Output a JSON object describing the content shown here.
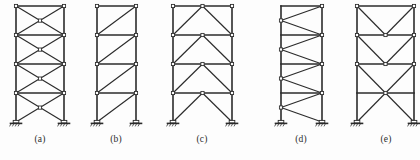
{
  "figure": {
    "background_color": "#fdfdfd",
    "line_color": "#2b2b2b",
    "joint_fill_color": "#ffffff",
    "member_stroke_width": 1.6,
    "brace_stroke_width": 1.2,
    "story_count": 4,
    "frames": [
      {
        "id": "a",
        "caption": "(a)",
        "bracing_type": "X-bracing",
        "description": "Cross (X) bracing in every story, all four stories braced",
        "left_column_x": 16,
        "right_column_x": 64,
        "caption_x": 40,
        "caption_y": 136,
        "levels_y": [
          6,
          35,
          64,
          93,
          122
        ],
        "braced_stories": [
          1,
          2,
          3,
          4
        ]
      },
      {
        "id": "b",
        "caption": "(b)",
        "bracing_type": "Single diagonal bracing",
        "description": "One diagonal per story running from lower-left to upper-right",
        "left_column_x": 97,
        "right_column_x": 136,
        "caption_x": 116,
        "caption_y": 136,
        "levels_y": [
          6,
          35,
          64,
          93,
          122
        ],
        "braced_stories": [
          1,
          2,
          3,
          4
        ]
      },
      {
        "id": "c",
        "caption": "(c)",
        "bracing_type": "Inverted-V (chevron) bracing",
        "description": "Two diagonals per story meeting at the midpoint of the beam above",
        "left_column_x": 173,
        "right_column_x": 232,
        "caption_x": 202,
        "caption_y": 136,
        "levels_y": [
          6,
          35,
          64,
          93,
          122
        ],
        "braced_stories": [
          1,
          2,
          3,
          4
        ]
      },
      {
        "id": "d",
        "caption": "(d)",
        "bracing_type": "Zigzag / alternating diagonal bracing",
        "description": "Continuous zigzag diagonals alternating between left and right columns",
        "left_column_x": 281,
        "right_column_x": 322,
        "caption_x": 301,
        "caption_y": 136,
        "levels_y": [
          6,
          35,
          64,
          93,
          122
        ],
        "braced_stories": [
          1,
          2,
          3,
          4
        ]
      },
      {
        "id": "e",
        "caption": "(e)",
        "bracing_type": "V-bracing with bottom X-brace",
        "description": "V (chevron down) bracing in upper stories and a two-story X-brace at the base",
        "left_column_x": 357,
        "right_column_x": 414,
        "caption_x": 386,
        "caption_y": 136,
        "levels_y": [
          6,
          35,
          64,
          93,
          122
        ],
        "braced_stories": [
          1,
          2,
          3,
          4
        ]
      }
    ],
    "support": {
      "type": "pinned-support-with-ground-hatching",
      "symbol_width": 9,
      "symbol_height": 4
    },
    "joint": {
      "type": "pin-joint-square-marker",
      "size": 3.2
    }
  }
}
